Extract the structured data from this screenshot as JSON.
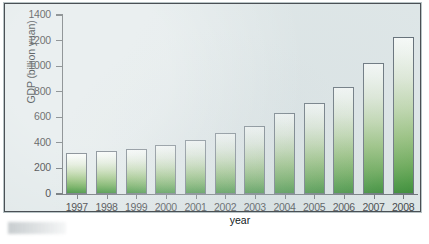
{
  "chart_data": {
    "type": "bar",
    "title": "",
    "xlabel": "year",
    "ylabel": "GDP (billion yuan)",
    "categories": [
      "1997",
      "1998",
      "1999",
      "2000",
      "2001",
      "2002",
      "2003",
      "2004",
      "2005",
      "2006",
      "2007",
      "2008"
    ],
    "values": [
      320,
      340,
      350,
      385,
      425,
      480,
      530,
      630,
      715,
      840,
      1025,
      1225
    ],
    "ylim": [
      0,
      1400
    ],
    "yticks": [
      0,
      200,
      400,
      600,
      800,
      1000,
      1200,
      1400
    ],
    "ytick_labels": [
      "0",
      "200",
      "400",
      "600",
      "800",
      "1000",
      "1200",
      "1400"
    ],
    "grid": false,
    "legend": false,
    "bar_fill": "white-to-green vertical gradient",
    "bar_edge_color": "#55606a",
    "plot_background": "#dfe7e8"
  },
  "figure": {
    "frame_border_color": "#4a5055",
    "background": "#ffffff"
  }
}
